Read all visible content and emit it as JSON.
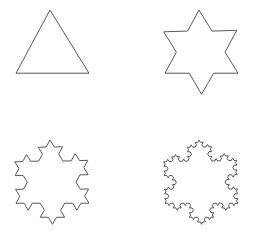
{
  "figure": {
    "background_color": "#ffffff",
    "stroke_color": "#464646",
    "stroke_width": 0.9,
    "width": 257,
    "height": 242,
    "layout": "2x2-grid"
  },
  "chart_data": {
    "type": "diagram",
    "subtitle": "",
    "xlabel": "",
    "ylabel": "",
    "grid": false,
    "legend": "none",
    "shape_family": "koch-snowflake",
    "panel_count": 4,
    "panels": [
      {
        "name": "koch-iteration-0",
        "label": "Equilateral triangle",
        "iteration": 0,
        "segment_count": 3,
        "center_x": 52.5,
        "center_y": 56.5,
        "side_length": 73,
        "base_y": 80,
        "apex_x": 50,
        "apex_y": 10,
        "base_left_x": 16,
        "base_right_x": 89,
        "rotation_deg": 0
      },
      {
        "name": "koch-iteration-1",
        "label": "Star of David",
        "iteration": 1,
        "segment_count": 12,
        "center_x": 201.5,
        "center_y": 56.5,
        "side_length": 73,
        "base_y": 80,
        "apex_x": 199,
        "apex_y": 10,
        "base_left_x": 165,
        "base_right_x": 238,
        "rotation_deg": 0
      },
      {
        "name": "koch-iteration-2",
        "label": "Koch snowflake level 2",
        "iteration": 2,
        "segment_count": 48,
        "center_x": 52.5,
        "center_y": 186.5,
        "side_length": 73,
        "base_y": 210,
        "apex_x": 50,
        "apex_y": 140,
        "base_left_x": 16,
        "base_right_x": 89,
        "rotation_deg": 0
      },
      {
        "name": "koch-iteration-3",
        "label": "Koch snowflake level 3",
        "iteration": 3,
        "segment_count": 192,
        "center_x": 201.5,
        "center_y": 186.5,
        "side_length": 73,
        "base_y": 210,
        "apex_x": 199,
        "apex_y": 140,
        "base_left_x": 165,
        "base_right_x": 238,
        "rotation_deg": 0
      }
    ]
  }
}
